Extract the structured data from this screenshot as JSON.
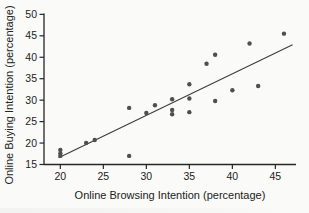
{
  "chart_data": {
    "type": "scatter",
    "title": "",
    "xlabel": "Online Browsing Intention (percentage)",
    "ylabel": "Online Buying Intention (percentage)",
    "xlim": [
      18.1,
      47.4
    ],
    "ylim": [
      15,
      50.2
    ],
    "x_ticks": [
      20,
      25,
      30,
      35,
      40,
      45
    ],
    "y_ticks": [
      15,
      20,
      25,
      30,
      35,
      40,
      45,
      50
    ],
    "grid": false,
    "legend": "none",
    "points": [
      [
        20,
        17.0
      ],
      [
        20,
        17.6
      ],
      [
        20,
        18.4
      ],
      [
        23,
        20.0
      ],
      [
        24,
        20.7
      ],
      [
        28,
        17.0
      ],
      [
        28,
        28.2
      ],
      [
        30,
        27.0
      ],
      [
        31,
        28.8
      ],
      [
        33,
        26.7
      ],
      [
        33,
        27.7
      ],
      [
        33,
        30.2
      ],
      [
        35,
        27.2
      ],
      [
        35,
        30.4
      ],
      [
        35,
        33.7
      ],
      [
        37,
        38.5
      ],
      [
        38,
        29.8
      ],
      [
        38,
        40.6
      ],
      [
        40,
        32.3
      ],
      [
        42,
        43.2
      ],
      [
        43,
        33.3
      ],
      [
        46,
        45.5
      ]
    ],
    "trendline": {
      "x1": 19.8,
      "y1": 16.6,
      "x2": 47.0,
      "y2": 42.9
    },
    "colors": {
      "background": "#fafaf8",
      "point": "#4f4f4f",
      "trend": "#3d3d3d",
      "axis": "#262626",
      "text": "#222222"
    }
  }
}
